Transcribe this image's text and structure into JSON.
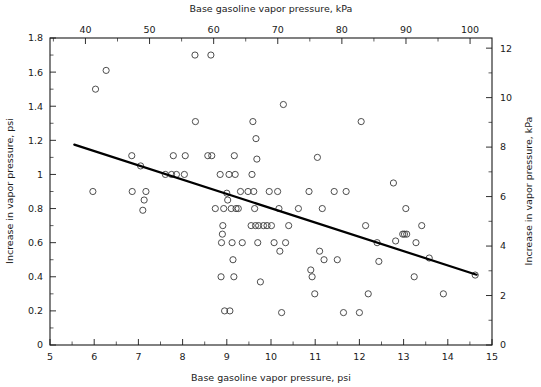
{
  "chart_data": {
    "type": "scatter",
    "title": "",
    "xlabel": "Base gasoline vapor pressure, psi",
    "ylabel": "Increase in vapor pressure, psi",
    "xlabel_top": "Base gasoline vapor pressure, kPa",
    "ylabel_right": "Increase in vapor pressure, kPa",
    "xlim": [
      5,
      15
    ],
    "ylim": [
      0,
      1.8
    ],
    "xlim_top": [
      34.47,
      103.42
    ],
    "ylim_right": [
      0,
      12.41
    ],
    "grid": false,
    "legend": null,
    "xticks": [
      5,
      6,
      7,
      8,
      9,
      10,
      11,
      12,
      13,
      14,
      15
    ],
    "xticklabels": [
      "5",
      "6",
      "7",
      "8",
      "9",
      "10",
      "11",
      "12",
      "13",
      "14",
      "15"
    ],
    "yticks": [
      0,
      0.2,
      0.4,
      0.6,
      0.8,
      1,
      1.2,
      1.4,
      1.6,
      1.8
    ],
    "yticklabels": [
      "0",
      "0.2",
      "0.4",
      "0.6",
      "0.8",
      "1",
      "1.2",
      "1.4",
      "1.6",
      "1.8"
    ],
    "xticks_top": [
      40,
      50,
      60,
      70,
      80,
      90,
      100
    ],
    "xticklabels_top": [
      "40",
      "50",
      "60",
      "70",
      "80",
      "90",
      "100"
    ],
    "xticks_top_minor": [
      35,
      45,
      55,
      65,
      75,
      85,
      95
    ],
    "yticks_right": [
      0,
      2,
      4,
      6,
      8,
      10,
      12
    ],
    "yticklabels_right": [
      "0",
      "2",
      "4",
      "6",
      "8",
      "10",
      "12"
    ],
    "marker": "open-circle",
    "marker_size": 3.1,
    "fit_line": {
      "type": "linear",
      "x_start": 5.55,
      "y_start": 1.175,
      "x_end": 14.65,
      "y_end": 0.412,
      "slope": -0.0838,
      "intercept": 1.6405
    },
    "points": [
      [
        5.97,
        0.9
      ],
      [
        6.03,
        1.5
      ],
      [
        6.27,
        1.61
      ],
      [
        6.85,
        1.11
      ],
      [
        6.86,
        0.9
      ],
      [
        7.05,
        1.05
      ],
      [
        7.1,
        0.79
      ],
      [
        7.13,
        0.85
      ],
      [
        7.17,
        0.9
      ],
      [
        7.61,
        1.0
      ],
      [
        7.75,
        1.0
      ],
      [
        7.79,
        1.11
      ],
      [
        7.86,
        1.0
      ],
      [
        8.04,
        1.0
      ],
      [
        8.06,
        1.11
      ],
      [
        8.28,
        1.7
      ],
      [
        8.29,
        1.31
      ],
      [
        8.57,
        1.11
      ],
      [
        8.66,
        1.11
      ],
      [
        8.64,
        1.7
      ],
      [
        8.74,
        0.8
      ],
      [
        8.85,
        1.0
      ],
      [
        8.87,
        0.4
      ],
      [
        8.88,
        0.6
      ],
      [
        8.9,
        0.65
      ],
      [
        8.91,
        0.7
      ],
      [
        8.93,
        0.8
      ],
      [
        8.95,
        0.2
      ],
      [
        9.0,
        0.89
      ],
      [
        9.02,
        0.85
      ],
      [
        9.05,
        1.0
      ],
      [
        9.07,
        0.2
      ],
      [
        9.1,
        0.8
      ],
      [
        9.12,
        0.6
      ],
      [
        9.14,
        0.5
      ],
      [
        9.16,
        0.4
      ],
      [
        9.17,
        1.11
      ],
      [
        9.19,
        1.0
      ],
      [
        9.21,
        0.8
      ],
      [
        9.26,
        0.8
      ],
      [
        9.31,
        0.9
      ],
      [
        9.35,
        0.6
      ],
      [
        9.48,
        0.9
      ],
      [
        9.55,
        0.7
      ],
      [
        9.57,
        1.0
      ],
      [
        9.59,
        1.31
      ],
      [
        9.61,
        0.9
      ],
      [
        9.63,
        0.8
      ],
      [
        9.65,
        0.7
      ],
      [
        9.66,
        1.21
      ],
      [
        9.68,
        1.09
      ],
      [
        9.7,
        0.6
      ],
      [
        9.72,
        0.7
      ],
      [
        9.76,
        0.37
      ],
      [
        9.83,
        0.7
      ],
      [
        9.91,
        0.7
      ],
      [
        9.96,
        0.9
      ],
      [
        10.01,
        0.7
      ],
      [
        10.07,
        0.6
      ],
      [
        10.15,
        0.9
      ],
      [
        10.18,
        0.8
      ],
      [
        10.2,
        0.55
      ],
      [
        10.24,
        0.19
      ],
      [
        10.28,
        1.41
      ],
      [
        10.33,
        0.6
      ],
      [
        10.4,
        0.7
      ],
      [
        10.62,
        0.8
      ],
      [
        10.86,
        0.9
      ],
      [
        10.9,
        0.44
      ],
      [
        10.93,
        0.4
      ],
      [
        10.99,
        0.3
      ],
      [
        11.05,
        1.1
      ],
      [
        11.1,
        0.55
      ],
      [
        11.16,
        0.8
      ],
      [
        11.2,
        0.5
      ],
      [
        11.43,
        0.9
      ],
      [
        11.5,
        0.5
      ],
      [
        11.64,
        0.19
      ],
      [
        11.7,
        0.9
      ],
      [
        12.0,
        0.19
      ],
      [
        12.04,
        1.31
      ],
      [
        12.14,
        0.7
      ],
      [
        12.2,
        0.3
      ],
      [
        12.4,
        0.6
      ],
      [
        12.44,
        0.49
      ],
      [
        12.77,
        0.95
      ],
      [
        12.82,
        0.61
      ],
      [
        12.98,
        0.65
      ],
      [
        13.02,
        0.65
      ],
      [
        13.05,
        0.8
      ],
      [
        13.07,
        0.65
      ],
      [
        13.24,
        0.4
      ],
      [
        13.28,
        0.6
      ],
      [
        13.41,
        0.7
      ],
      [
        13.58,
        0.51
      ],
      [
        13.9,
        0.3
      ],
      [
        14.62,
        0.41
      ]
    ]
  },
  "plot_geometry": {
    "left_px": 50,
    "right_px": 492,
    "top_px": 38,
    "bottom_px": 345
  }
}
